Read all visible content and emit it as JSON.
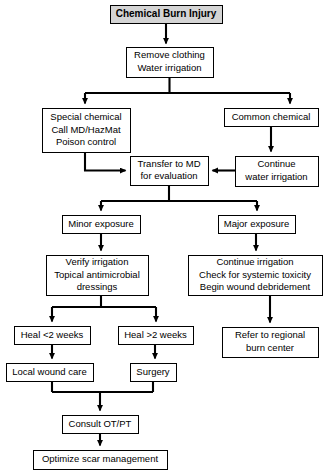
{
  "diagram": {
    "title": "Chemical Burn Injury",
    "type": "flowchart",
    "background_color": "#ffffff",
    "line_color": "#000000",
    "header_fill_color": "#d4d4d4",
    "node_fill_color": "#ffffff",
    "nodes": [
      {
        "id": "chemical-burn-injury",
        "lines": [
          "Chemical Burn Injury"
        ],
        "x": 110,
        "y": 5,
        "w": 112,
        "h": 18,
        "style": "header"
      },
      {
        "id": "remove-clothing",
        "lines": [
          "Remove clothing",
          "Water irrigation"
        ],
        "x": 126,
        "y": 47,
        "w": 87,
        "h": 30,
        "style": "normal"
      },
      {
        "id": "special-chemical",
        "lines": [
          "Special chemical",
          "Call MD/HazMat",
          "Poison control"
        ],
        "x": 42,
        "y": 108,
        "w": 88,
        "h": 44,
        "style": "normal"
      },
      {
        "id": "common-chemical",
        "lines": [
          "Common chemical"
        ],
        "x": 224,
        "y": 108,
        "w": 94,
        "h": 18,
        "style": "normal"
      },
      {
        "id": "transfer-to-md",
        "lines": [
          "Transfer to MD",
          "for evaluation"
        ],
        "x": 130,
        "y": 156,
        "w": 78,
        "h": 29,
        "style": "normal"
      },
      {
        "id": "continue-water-irrigation",
        "lines": [
          "Continue",
          "water irrigation"
        ],
        "x": 235,
        "y": 156,
        "w": 83,
        "h": 30,
        "style": "normal"
      },
      {
        "id": "minor-exposure",
        "lines": [
          "Minor exposure"
        ],
        "x": 62,
        "y": 215,
        "w": 78,
        "h": 18,
        "style": "normal"
      },
      {
        "id": "major-exposure",
        "lines": [
          "Major exposure"
        ],
        "x": 218,
        "y": 215,
        "w": 77,
        "h": 18,
        "style": "normal"
      },
      {
        "id": "verify-irrigation",
        "lines": [
          "Verify irrigation",
          "Topical antimicrobial",
          "dressings"
        ],
        "x": 46,
        "y": 255,
        "w": 102,
        "h": 40,
        "style": "normal"
      },
      {
        "id": "continue-irrigation",
        "lines": [
          "Continue irrigation",
          "Check for systemic toxicity",
          "Begin wound debridement"
        ],
        "x": 188,
        "y": 255,
        "w": 134,
        "h": 40,
        "style": "normal"
      },
      {
        "id": "heal-less-2-weeks",
        "lines": [
          "Heal <2 weeks"
        ],
        "x": 14,
        "y": 326,
        "w": 76,
        "h": 18,
        "style": "normal"
      },
      {
        "id": "heal-more-2-weeks",
        "lines": [
          "Heal >2 weeks"
        ],
        "x": 118,
        "y": 326,
        "w": 75,
        "h": 18,
        "style": "normal"
      },
      {
        "id": "refer-to-regional-burn-center",
        "lines": [
          "Refer to regional",
          "burn center"
        ],
        "x": 222,
        "y": 327,
        "w": 96,
        "h": 30,
        "style": "normal"
      },
      {
        "id": "local-wound-care",
        "lines": [
          "Local wound care"
        ],
        "x": 6,
        "y": 363,
        "w": 87,
        "h": 18,
        "style": "normal"
      },
      {
        "id": "surgery",
        "lines": [
          "Surgery"
        ],
        "x": 130,
        "y": 363,
        "w": 46,
        "h": 18,
        "style": "normal"
      },
      {
        "id": "consult-ot-pt",
        "lines": [
          "Consult OT/PT"
        ],
        "x": 62,
        "y": 415,
        "w": 76,
        "h": 18,
        "style": "normal"
      },
      {
        "id": "optimize-scar-management",
        "lines": [
          "Optimize scar management"
        ],
        "x": 33,
        "y": 450,
        "w": 134,
        "h": 19,
        "style": "normal"
      }
    ],
    "edges": [
      {
        "id": "injury-to-remove",
        "from": "chemical-burn-injury",
        "to": "remove-clothing",
        "kind": "arrow-down"
      },
      {
        "id": "remove-to-special",
        "from": "remove-clothing",
        "to": "special-chemical",
        "kind": "split-left"
      },
      {
        "id": "remove-to-common",
        "from": "remove-clothing",
        "to": "common-chemical",
        "kind": "split-right"
      },
      {
        "id": "special-to-transfer",
        "from": "special-chemical",
        "to": "transfer-to-md",
        "kind": "elbow-right"
      },
      {
        "id": "common-to-continue",
        "from": "common-chemical",
        "to": "continue-water-irrigation",
        "kind": "arrow-down"
      },
      {
        "id": "continue-to-transfer",
        "from": "continue-water-irrigation",
        "to": "transfer-to-md",
        "kind": "arrow-left"
      },
      {
        "id": "transfer-to-minor",
        "from": "transfer-to-md",
        "to": "minor-exposure",
        "kind": "split-left"
      },
      {
        "id": "transfer-to-major",
        "from": "transfer-to-md",
        "to": "major-exposure",
        "kind": "split-right"
      },
      {
        "id": "minor-to-verify",
        "from": "minor-exposure",
        "to": "verify-irrigation",
        "kind": "arrow-down"
      },
      {
        "id": "major-to-continue-irrigation",
        "from": "major-exposure",
        "to": "continue-irrigation",
        "kind": "arrow-down"
      },
      {
        "id": "verify-to-heal-less",
        "from": "verify-irrigation",
        "to": "heal-less-2-weeks",
        "kind": "split-left"
      },
      {
        "id": "verify-to-heal-more",
        "from": "verify-irrigation",
        "to": "heal-more-2-weeks",
        "kind": "split-right"
      },
      {
        "id": "continue-irrigation-to-refer",
        "from": "continue-irrigation",
        "to": "refer-to-regional-burn-center",
        "kind": "arrow-down"
      },
      {
        "id": "heal-less-to-local",
        "from": "heal-less-2-weeks",
        "to": "local-wound-care",
        "kind": "arrow-down"
      },
      {
        "id": "heal-more-to-surgery",
        "from": "heal-more-2-weeks",
        "to": "surgery",
        "kind": "arrow-down"
      },
      {
        "id": "local-and-surgery-to-consult",
        "from": "local-wound-care",
        "to": "consult-ot-pt",
        "kind": "merge-down"
      },
      {
        "id": "consult-to-optimize",
        "from": "consult-ot-pt",
        "to": "optimize-scar-management",
        "kind": "arrow-down"
      }
    ]
  }
}
